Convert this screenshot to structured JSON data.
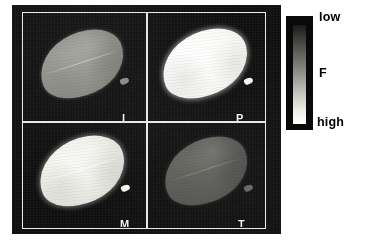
{
  "figure": {
    "type": "fluorescence-image-montage",
    "background_color": "#ffffff",
    "image_background_color": "#0d0d0d",
    "frame_color": "#e9e9e4"
  },
  "panels": [
    {
      "label": "I",
      "position": "top-left",
      "leaf_tone": "medium gray",
      "relative_fluorescence": "medium"
    },
    {
      "label": "P",
      "position": "top-right",
      "leaf_tone": "bright white",
      "relative_fluorescence": "high"
    },
    {
      "label": "M",
      "position": "bottom-left",
      "leaf_tone": "light near-white",
      "relative_fluorescence": "high"
    },
    {
      "label": "T",
      "position": "bottom-right",
      "leaf_tone": "dark gray",
      "relative_fluorescence": "low"
    }
  ],
  "colorbar": {
    "quantity_label": "F",
    "top_label": "low",
    "bottom_label": "high",
    "orientation": "vertical",
    "gradient_top_color": "#1a1a1a",
    "gradient_bottom_color": "#ffffff",
    "label_color": "#000000"
  },
  "chart_data": {
    "type": "heatmap",
    "title": "",
    "xlabel": "",
    "ylabel": "",
    "categories": [
      "I",
      "P",
      "M",
      "T"
    ],
    "series": [
      {
        "name": "mean grayscale intensity (0-255)",
        "values": [
          150,
          250,
          235,
          100
        ]
      }
    ],
    "colorbar": {
      "label": "F",
      "ticks": [
        "low",
        "high"
      ],
      "tick_positions": [
        0,
        1
      ],
      "cmap": "gray",
      "reversed": true,
      "note": "dark = low F at top of bar, light = high F at bottom of bar"
    },
    "grid": false,
    "legend": "right"
  }
}
